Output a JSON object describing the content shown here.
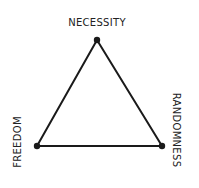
{
  "diagram": {
    "type": "triangle",
    "vertices": {
      "top": {
        "label": "NECESSITY",
        "x": 97,
        "y": 40
      },
      "bottom_left": {
        "label": "FREEDOM",
        "x": 37,
        "y": 146
      },
      "bottom_right": {
        "label": "RANDOMNESS",
        "x": 162,
        "y": 146
      }
    },
    "stroke_color": "#1a1a1a",
    "text_color": "#222222"
  }
}
